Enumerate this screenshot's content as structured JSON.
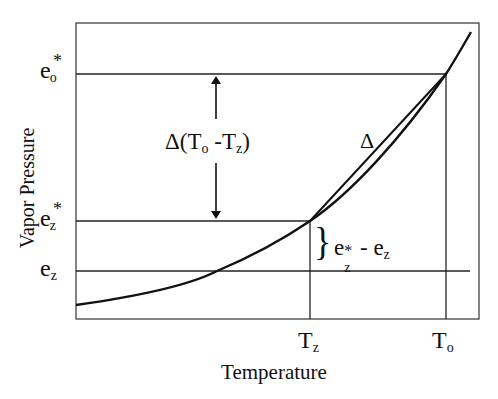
{
  "diagram": {
    "xlabel": "Temperature",
    "ylabel": "Vapor Pressure",
    "y_ticks": [
      {
        "id": "eo_star",
        "base": "e",
        "sub": "o",
        "sup": "*",
        "y": 74
      },
      {
        "id": "ez_star",
        "base": "e",
        "sub": "z",
        "sup": "*",
        "y": 221
      },
      {
        "id": "ez",
        "base": "e",
        "sub": "z",
        "sup": "",
        "y": 271
      }
    ],
    "x_ticks": [
      {
        "id": "tz",
        "base": "T",
        "sub": "z",
        "x": 310
      },
      {
        "id": "to",
        "base": "T",
        "sub": "o",
        "x": 446
      }
    ],
    "annotations": {
      "delta_t": {
        "prefix": "Δ(T",
        "sub1": "o",
        "mid": " -T",
        "sub2": "z",
        "suffix": ")"
      },
      "delta": "Δ",
      "bracket_label": {
        "base1": "e",
        "sup": "*",
        "sub1": "z",
        "mid": " - e",
        "sub2": "z"
      },
      "brace": "}"
    },
    "colors": {
      "line": "#111111",
      "background": "#ffffff"
    }
  }
}
